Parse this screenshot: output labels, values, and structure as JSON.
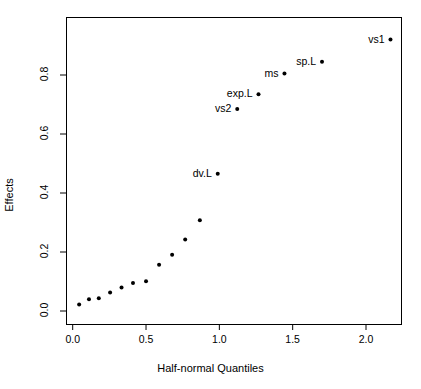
{
  "chart_data": {
    "type": "scatter",
    "title": "",
    "xlabel": "Half-normal Quantiles",
    "ylabel": "Effects",
    "xlim": [
      -0.06,
      2.29
    ],
    "ylim": [
      -0.015,
      0.945
    ],
    "xticks": [
      0.0,
      0.5,
      1.0,
      1.5,
      2.0
    ],
    "xticklabels": [
      "0.0",
      "0.5",
      "1.0",
      "1.5",
      "2.0"
    ],
    "yticks": [
      0.0,
      0.2,
      0.4,
      0.6,
      0.8
    ],
    "yticklabels": [
      "0.0",
      "0.2",
      "0.4",
      "0.6",
      "0.8"
    ],
    "grid": false,
    "legend": null,
    "marker": "filled-circle",
    "marker_color": "#000000",
    "marker_size_px": 4,
    "box": true,
    "points": [
      {
        "x": 0.044,
        "y": 0.022,
        "label": ""
      },
      {
        "x": 0.111,
        "y": 0.04,
        "label": ""
      },
      {
        "x": 0.178,
        "y": 0.043,
        "label": ""
      },
      {
        "x": 0.255,
        "y": 0.063,
        "label": ""
      },
      {
        "x": 0.333,
        "y": 0.08,
        "label": ""
      },
      {
        "x": 0.411,
        "y": 0.095,
        "label": ""
      },
      {
        "x": 0.5,
        "y": 0.101,
        "label": ""
      },
      {
        "x": 0.589,
        "y": 0.157,
        "label": ""
      },
      {
        "x": 0.678,
        "y": 0.191,
        "label": ""
      },
      {
        "x": 0.767,
        "y": 0.242,
        "label": ""
      },
      {
        "x": 0.867,
        "y": 0.308,
        "label": ""
      },
      {
        "x": 0.989,
        "y": 0.465,
        "label": "dv.L"
      },
      {
        "x": 1.122,
        "y": 0.685,
        "label": "vs2"
      },
      {
        "x": 1.267,
        "y": 0.735,
        "label": "exp.L"
      },
      {
        "x": 1.444,
        "y": 0.805,
        "label": "ms"
      },
      {
        "x": 1.7,
        "y": 0.845,
        "label": "sp.L"
      },
      {
        "x": 2.167,
        "y": 0.92,
        "label": "vs1"
      }
    ]
  }
}
